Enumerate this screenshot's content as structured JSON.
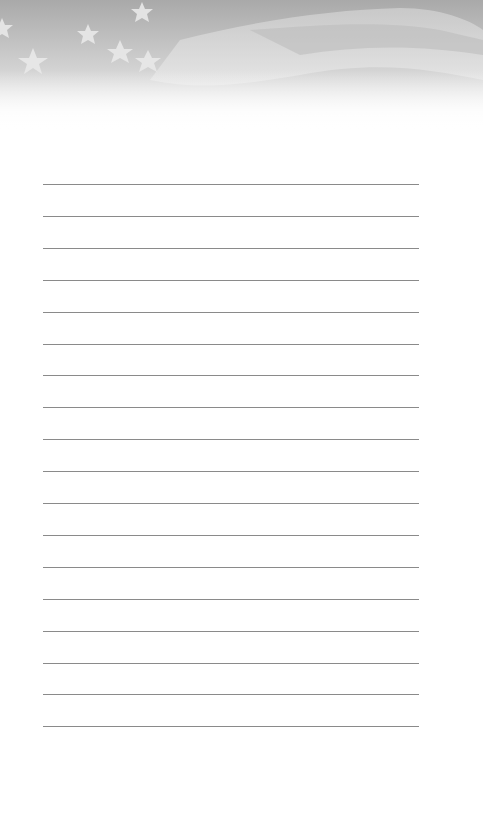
{
  "page": {
    "type": "lined notepad page",
    "header": {
      "image": "american-flag-grayscale",
      "description": "Waving flag with stars"
    },
    "ruled_lines_count": 18,
    "colors": {
      "background": "#ffffff",
      "rule": "#8a8a8a",
      "header_tone": "#b5b5b5"
    }
  }
}
